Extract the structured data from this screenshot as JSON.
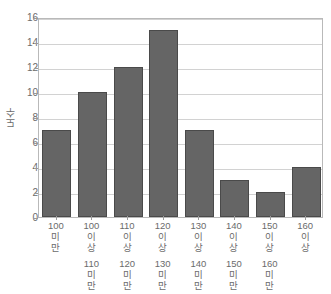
{
  "chart_data": {
    "type": "bar",
    "title": "",
    "xlabel": "",
    "ylabel": "도수",
    "ylim": [
      0,
      16
    ],
    "ytick_step": 2,
    "yticks": [
      0,
      2,
      4,
      6,
      8,
      10,
      12,
      14,
      16
    ],
    "grid": true,
    "legend": false,
    "categories": [
      "100 미만",
      "100 이상 110 미만",
      "110 이상 120 미만",
      "120 이상 130 미만",
      "130 이상 140 미만",
      "140 이상 150 미만",
      "150 이상 160 미만",
      "160 이상"
    ],
    "category_lines": [
      [
        "100",
        "미",
        "만"
      ],
      [
        "100",
        "이",
        "상",
        "",
        "110",
        "미",
        "만"
      ],
      [
        "110",
        "이",
        "상",
        "",
        "120",
        "미",
        "만"
      ],
      [
        "120",
        "이",
        "상",
        "",
        "130",
        "미",
        "만"
      ],
      [
        "130",
        "이",
        "상",
        "",
        "140",
        "미",
        "만"
      ],
      [
        "140",
        "이",
        "상",
        "",
        "150",
        "미",
        "만"
      ],
      [
        "150",
        "이",
        "상",
        "",
        "160",
        "미",
        "만"
      ],
      [
        "160",
        "이",
        "상"
      ]
    ],
    "values": [
      7,
      10,
      12,
      15,
      7,
      3,
      2,
      4
    ],
    "bar_color": "#656565",
    "bar_edge_color": "#4a4a4a",
    "grid_color": "#d2d2d2",
    "axis_color": "#b9b9b9",
    "text_color": "#6b6b6b"
  },
  "footer": {
    "caption": ""
  }
}
